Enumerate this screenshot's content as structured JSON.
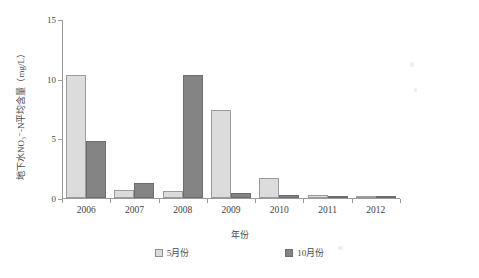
{
  "chart_data": {
    "type": "bar",
    "title": "",
    "xlabel": "年份",
    "ylabel": "地下水NO₃⁻-N平均含量（mg/L）",
    "categories": [
      "2006",
      "2007",
      "2008",
      "2009",
      "2010",
      "2011",
      "2012"
    ],
    "series": [
      {
        "name": "5月份",
        "color": "#dcdcdc",
        "values": [
          10.3,
          0.7,
          0.6,
          7.4,
          1.7,
          0.25,
          0.2
        ]
      },
      {
        "name": "10月份",
        "color": "#848484",
        "values": [
          4.8,
          1.3,
          10.3,
          0.4,
          0.25,
          0.15,
          0.2
        ]
      }
    ],
    "ylim": [
      0,
      15
    ],
    "yticks": [
      0,
      5,
      10,
      15
    ],
    "ytick_labels": [
      "0",
      "5",
      "10",
      "15"
    ],
    "grid": false,
    "legend_position": "bottom"
  },
  "caption": {
    "text": ""
  }
}
